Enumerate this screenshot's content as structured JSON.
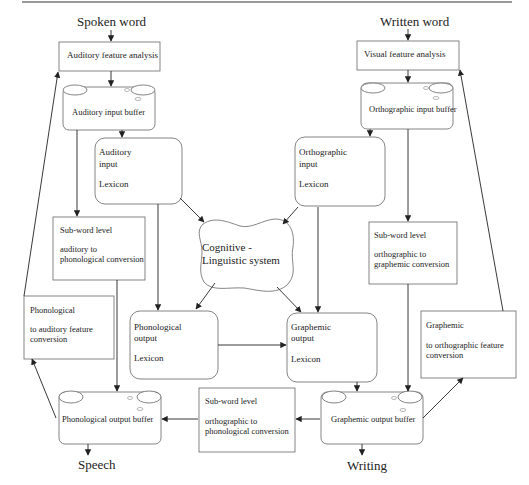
{
  "inputs": {
    "spoken_word": "Spoken word",
    "written_word": "Written word"
  },
  "outputs": {
    "speech": "Speech",
    "writing": "Writing"
  },
  "boxes": {
    "auditory_feature_analysis": "Auditory feature analysis",
    "visual_feature_analysis": "Visual feature analysis",
    "auditory_input_buffer": "Auditory input buffer",
    "orthographic_input_buffer": "Orthographic input buffer",
    "auditory_input_lexicon": {
      "line1": "Auditory",
      "line2": "input",
      "line3": "Lexicon"
    },
    "orthographic_input_lexicon": {
      "line1": "Orthographic",
      "line2": "input",
      "line3": "Lexicon"
    },
    "cognitive_linguistic_system": {
      "line1": "Cognitive -",
      "line2": "Linguistic system"
    },
    "subword_auditory_to_phonological": {
      "line1": "Sub-word level",
      "line2": "auditory to",
      "line3": "phonological  conversion"
    },
    "subword_orthographic_to_graphemic": {
      "line1": "Sub-word level",
      "line2": "orthographic to",
      "line3": "graphemic  conversion"
    },
    "phonological_to_auditory_feature": {
      "line1": "Phonological",
      "line2": "to auditory feature",
      "line3": "conversion"
    },
    "graphemic_to_orthographic_feature": {
      "line1": "Graphemic",
      "line2": "to orthographic feature",
      "line3": "conversion"
    },
    "phonological_output_lexicon": {
      "line1": "Phonological",
      "line2": "output",
      "line3": "Lexicon"
    },
    "graphemic_output_lexicon": {
      "line1": "Graphemic",
      "line2": "output",
      "line3": "Lexicon"
    },
    "subword_orthographic_to_phonological": {
      "line1": "Sub-word level",
      "line2": "orthographic to",
      "line3": "phonological  conversion"
    },
    "phonological_output_buffer": "Phonological output buffer",
    "graphemic_output_buffer": "Graphemic output buffer"
  },
  "colors": {
    "stroke": "#555555",
    "arrow": "#222222",
    "rule": "#888888"
  }
}
